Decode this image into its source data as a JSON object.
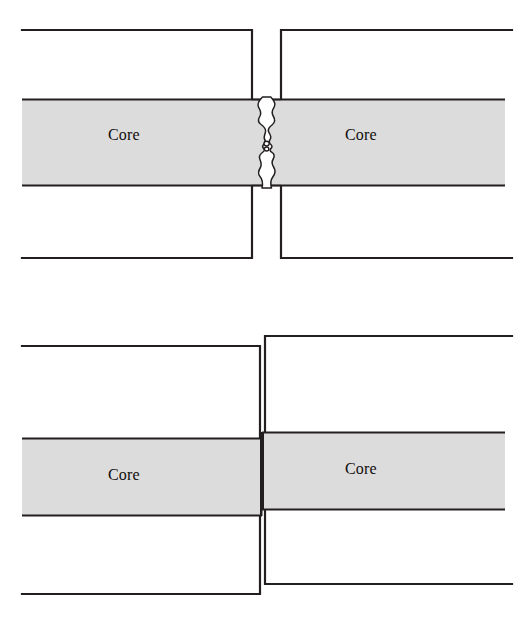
{
  "figure": {
    "kind": "technical-line-diagram",
    "panel_count": 2,
    "background_color": "#ffffff",
    "line_color": "#231f20",
    "core_fill_color": "#dcdcdc",
    "core_edge_color": "#231f20",
    "gap_fill_color": "#ffffff"
  },
  "panels": [
    {
      "id": "air-gap",
      "name": "longitudinal-air-gap",
      "description": "Two fiber ends separated by a narrow irregular air gap; cores are collinear but not touching",
      "left_fiber": {
        "core_label": "Core",
        "cladding_top_y": 30,
        "cladding_bottom_y": 258,
        "core_top_y": 99,
        "core_bottom_y": 186,
        "x_start": 22,
        "x_end": 252
      },
      "right_fiber": {
        "core_label": "Core",
        "cladding_top_y": 30,
        "cladding_bottom_y": 258,
        "core_top_y": 99,
        "core_bottom_y": 186,
        "x_start": 281,
        "x_end": 512
      },
      "gap": {
        "name": "air-gap",
        "x_left": 252,
        "x_right": 281,
        "shape": "irregular-wavy-fracture"
      }
    },
    {
      "id": "axial-offset",
      "name": "lateral-core-offset",
      "description": "Two fiber ends butted together but laterally offset so the cores do not line up",
      "left_fiber": {
        "core_label": "Core",
        "cladding_top_y": 346,
        "cladding_bottom_y": 594,
        "core_top_y": 438,
        "core_bottom_y": 516,
        "x_start": 22,
        "x_end": 260
      },
      "right_fiber": {
        "core_label": "Core",
        "cladding_top_y": 336,
        "cladding_bottom_y": 584,
        "core_top_y": 432,
        "core_bottom_y": 510,
        "x_start": 265,
        "x_end": 512
      },
      "offset": {
        "name": "lateral-offset",
        "direction": "vertical",
        "magnitude_px": 6
      }
    }
  ],
  "labels": {
    "core": "Core"
  }
}
